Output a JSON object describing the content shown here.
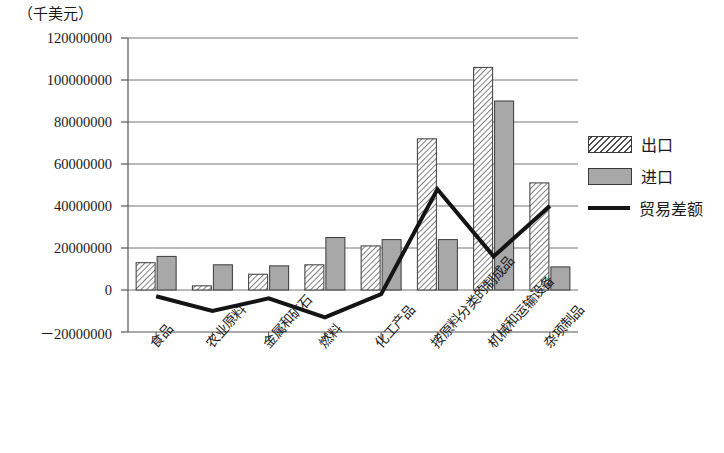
{
  "chart_data": {
    "type": "bar",
    "title": "",
    "subtitle": "",
    "unit_label": "（千美元）",
    "xlabel": "",
    "ylabel": "",
    "categories": [
      "食品",
      "农业原料",
      "金属和矿石",
      "燃料",
      "化工产品",
      "按原料分类的制成品",
      "机械和运输设备",
      "杂项制品"
    ],
    "series": [
      {
        "name": "出口",
        "type": "bar",
        "style": "hatched",
        "values": [
          13000000,
          2000000,
          7500000,
          12000000,
          21000000,
          72000000,
          106000000,
          51000000
        ]
      },
      {
        "name": "进口",
        "type": "bar",
        "style": "solid-gray",
        "values": [
          16000000,
          12000000,
          11500000,
          25000000,
          24000000,
          24000000,
          90000000,
          11000000
        ]
      },
      {
        "name": "贸易差额",
        "type": "line",
        "style": "black-line",
        "values": [
          -3000000,
          -10000000,
          -4000000,
          -13000000,
          -2000000,
          48000000,
          16000000,
          40000000
        ]
      }
    ],
    "ylim": [
      -20000000,
      120000000
    ],
    "yticks": [
      120000000,
      100000000,
      80000000,
      60000000,
      40000000,
      20000000,
      0,
      -20000000
    ],
    "ytick_labels": [
      "120000000",
      "100000000",
      "80000000",
      "60000000",
      "40000000",
      "20000000",
      "0",
      "－20000000"
    ],
    "grid": true,
    "legend_position": "right",
    "colors": {
      "export_fill": "#ffffff",
      "export_hatch": "#4a4a4a",
      "import_fill": "#a8a8a8",
      "line": "#141414",
      "axis": "#555555",
      "grid": "#777777"
    }
  },
  "legend": {
    "entries": [
      {
        "label": "出口",
        "swatch": "hatched-rect-swatch"
      },
      {
        "label": "进口",
        "swatch": "gray-rect-swatch"
      },
      {
        "label": "贸易差额",
        "swatch": "black-line-swatch"
      }
    ]
  }
}
